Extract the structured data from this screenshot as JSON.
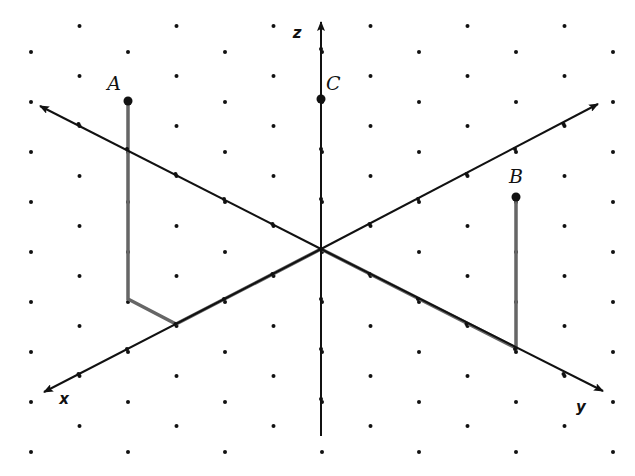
{
  "diagram": {
    "type": "3d-coordinate-axes-isometric",
    "colors": {
      "axis": "#111111",
      "path": "#666666",
      "dot": "#111111",
      "background": "#ffffff"
    },
    "grid": {
      "dx": 48.5,
      "dy": 50,
      "x0": 31,
      "even_start_y": 52,
      "odd_start_y": 26,
      "columns": 13
    },
    "origin": {
      "px": 321,
      "py": 249
    },
    "unit_vectors": {
      "x": [
        -48.5,
        25
      ],
      "y": [
        48.5,
        25
      ],
      "z": [
        0,
        -50
      ]
    },
    "axes": [
      {
        "name": "x",
        "label": "x",
        "from": [
          321,
          249
        ],
        "to": [
          44,
          392
        ],
        "label_pos": [
          64,
          404
        ]
      },
      {
        "name": "y",
        "label": "y",
        "from": [
          321,
          249
        ],
        "to": [
          603,
          391
        ],
        "label_pos": [
          581,
          412
        ]
      },
      {
        "name": "z",
        "label": "z",
        "from": [
          321,
          436
        ],
        "to": [
          321,
          22
        ],
        "label_pos": [
          297,
          38
        ]
      },
      {
        "name": "x-neg-y",
        "label": "",
        "from": [
          321,
          249
        ],
        "to": [
          40,
          106
        ]
      },
      {
        "name": "y-neg-x",
        "label": "",
        "from": [
          321,
          249
        ],
        "to": [
          598,
          104
        ]
      }
    ],
    "points": [
      {
        "label": "A",
        "coords": [
          3,
          -1,
          4
        ],
        "px": 128,
        "py": 101,
        "label_pos": [
          114,
          90
        ]
      },
      {
        "label": "B",
        "coords": [
          0,
          4,
          3
        ],
        "px": 516,
        "py": 197,
        "label_pos": [
          516,
          183
        ]
      },
      {
        "label": "C",
        "coords": [
          0,
          0,
          3
        ],
        "px": 321,
        "py": 99,
        "label_pos": [
          326,
          90
        ]
      }
    ],
    "paths": [
      {
        "name": "path-to-A",
        "points": [
          [
            321,
            249
          ],
          [
            176,
            324
          ],
          [
            128,
            299
          ],
          [
            128,
            101
          ]
        ]
      },
      {
        "name": "path-to-B",
        "points": [
          [
            321,
            249
          ],
          [
            516,
            348
          ],
          [
            516,
            197
          ]
        ]
      }
    ]
  }
}
